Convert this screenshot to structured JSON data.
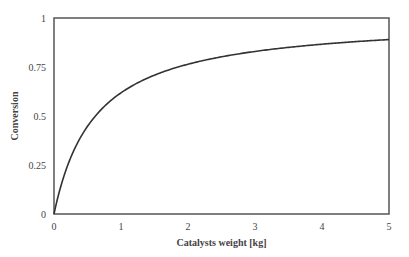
{
  "chart_data": {
    "type": "line",
    "title": "",
    "xlabel": "Catalysts weight [kg]",
    "ylabel": "Conversion",
    "xlim": [
      0,
      5
    ],
    "ylim": [
      0,
      1
    ],
    "x_ticks": [
      "0",
      "1",
      "2",
      "3",
      "4",
      "5"
    ],
    "y_ticks": [
      "0",
      "0.25",
      "0.5",
      "0.75",
      "1"
    ],
    "grid": false,
    "legend": null,
    "series": [
      {
        "name": "Conversion",
        "color": "#333333",
        "x": [
          0,
          0.1,
          0.25,
          0.5,
          0.75,
          1,
          1.5,
          2,
          2.5,
          3,
          3.5,
          4,
          4.5,
          5
        ],
        "values": [
          0,
          0.14,
          0.29,
          0.44,
          0.54,
          0.61,
          0.7,
          0.76,
          0.8,
          0.83,
          0.85,
          0.865,
          0.88,
          0.89
        ]
      }
    ]
  },
  "plot": {
    "left": 54,
    "top": 18,
    "right": 389,
    "bottom": 214,
    "frame_color": "#555555"
  }
}
